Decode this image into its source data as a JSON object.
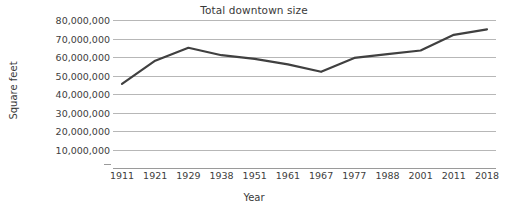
{
  "chart_data": {
    "type": "line",
    "title": "Total downtown size",
    "xlabel": "Year",
    "ylabel": "Square feet",
    "categories": [
      "1911",
      "1921",
      "1929",
      "1938",
      "1951",
      "1961",
      "1967",
      "1977",
      "1988",
      "2001",
      "2011",
      "2018"
    ],
    "values": [
      45500000,
      58000000,
      65000000,
      61000000,
      59000000,
      56000000,
      52000000,
      59500000,
      61500000,
      63500000,
      72000000,
      75000000
    ],
    "series": [
      {
        "name": "Total downtown size",
        "values": [
          45500000,
          58000000,
          65000000,
          61000000,
          59000000,
          56000000,
          52000000,
          59500000,
          61500000,
          63500000,
          72000000,
          75000000
        ]
      }
    ],
    "ylim": [
      0,
      80000000
    ],
    "ytick_labels": [
      "80,000,000",
      "70,000,000",
      "60,000,000",
      "50,000,000",
      "40,000,000",
      "30,000,000",
      "20,000,000",
      "10,000,000"
    ],
    "ytick_values": [
      80000000,
      70000000,
      60000000,
      50000000,
      40000000,
      30000000,
      20000000,
      10000000
    ],
    "grid": true,
    "legend": "none",
    "line_color": "#404040",
    "grid_color": "#b7b7b7",
    "background_color": "#ffffff",
    "text_color": "#3a3a3a"
  }
}
